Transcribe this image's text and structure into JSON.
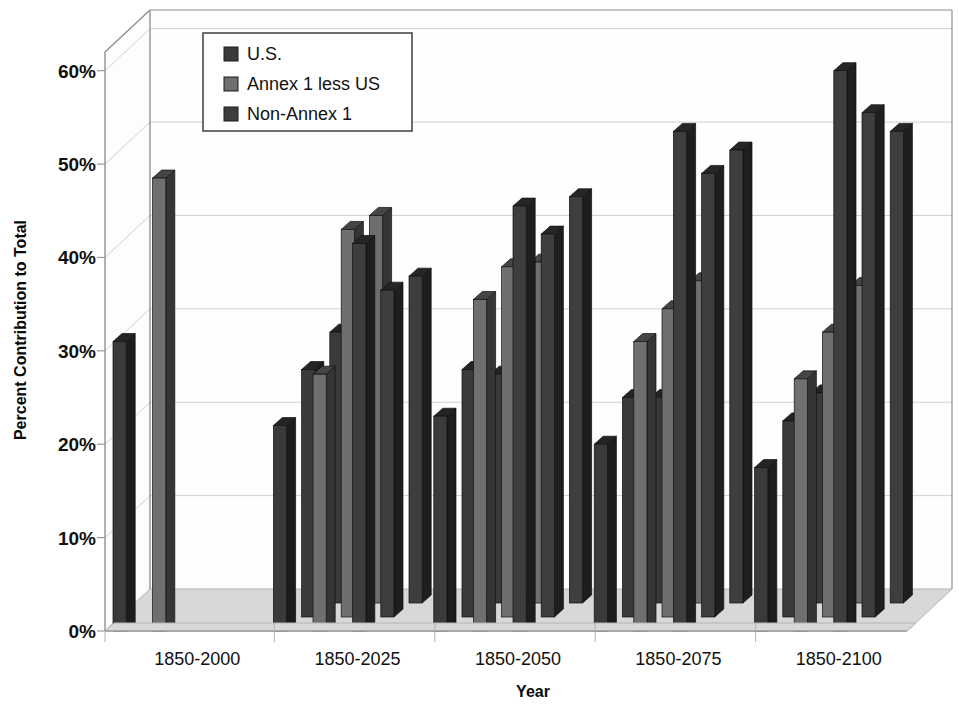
{
  "chart_data": {
    "type": "bar",
    "title": "",
    "subtitle": "",
    "xlabel": "Year",
    "ylabel": "Percent Contribution to Total",
    "categories": [
      "1850-2000",
      "1850-2025",
      "1850-2050",
      "1850-2075",
      "1850-2100"
    ],
    "ylim": [
      0,
      62
    ],
    "yticks": [
      0,
      10,
      20,
      30,
      40,
      50,
      60
    ],
    "ytick_labels": [
      "0%",
      "10%",
      "20%",
      "30%",
      "40%",
      "50%",
      "60%"
    ],
    "grid": true,
    "legend_position": "top-left",
    "three_d": true,
    "depth_rows": 3,
    "series": [
      {
        "name": "U.S.",
        "color": "#3a3a3a",
        "rows": [
          [
            31.0,
            22.0,
            23.0,
            20.0,
            17.5
          ],
          [
            null,
            26.5,
            26.5,
            23.5,
            21.0
          ],
          [
            null,
            29.0,
            24.5,
            22.0,
            22.5
          ]
        ]
      },
      {
        "name": "Annex 1 less US",
        "color": "#6f6f6f",
        "rows": [
          [
            48.5,
            27.5,
            35.5,
            31.0,
            27.0
          ],
          [
            null,
            41.5,
            37.5,
            33.0,
            30.5
          ],
          [
            null,
            41.5,
            36.5,
            34.5,
            34.0
          ]
        ]
      },
      {
        "name": "Non-Annex 1",
        "color": "#3e3e3e",
        "rows": [
          [
            null,
            41.5,
            45.5,
            53.5,
            60.0
          ],
          [
            null,
            35.0,
            41.0,
            47.5,
            54.0
          ],
          [
            null,
            35.0,
            43.5,
            48.5,
            50.5
          ]
        ]
      }
    ],
    "legend_entries": [
      {
        "label": "U.S.",
        "color": "#3a3a3a"
      },
      {
        "label": "Annex 1 less US",
        "color": "#6f6f6f"
      },
      {
        "label": "Non-Annex 1",
        "color": "#3e3e3e"
      }
    ]
  },
  "colors": {
    "background": "#ffffff",
    "floor": "#d8d8d8",
    "wall": "#fefefe",
    "grid": "#d0d0d0",
    "frame": "#909090",
    "bar_top": "#1e1e1e",
    "bar_side": "#1a1a1a",
    "text": "#111111"
  }
}
